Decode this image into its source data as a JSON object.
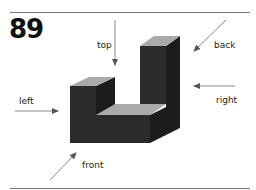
{
  "figure": {
    "number": "89",
    "labels": {
      "top": "top",
      "back": "back",
      "left": "left",
      "right": "right",
      "front": "front"
    },
    "colors": {
      "front_face": "#2b2b2b",
      "side_face": "#1a1a1a",
      "top_face": "#a8a8a8",
      "arrow": "#888888",
      "rule": "#777777"
    }
  }
}
